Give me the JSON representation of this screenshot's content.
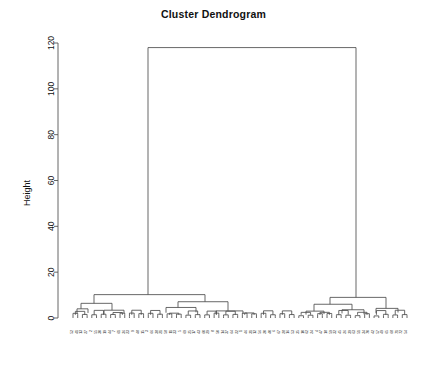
{
  "chart_data": {
    "type": "dendrogram",
    "title": "Cluster Dendrogram",
    "xlabel": "",
    "ylabel": "Height",
    "ylim": [
      0,
      125
    ],
    "yticks": [
      0,
      20,
      40,
      60,
      80,
      100,
      120
    ],
    "ytick_labels": [
      "0",
      "20",
      "40",
      "60",
      "80",
      "100",
      "120"
    ],
    "grid": false,
    "legend": "none",
    "n_leaves": 72,
    "root_height": 118,
    "leaf_labels": [
      "52",
      "41",
      "13",
      "27",
      "2",
      "55",
      "30",
      "19",
      "44",
      "7",
      "61",
      "36",
      "23",
      "9",
      "48",
      "15",
      "3",
      "66",
      "38",
      "21",
      "58",
      "11",
      "33",
      "5",
      "69",
      "25",
      "17",
      "43",
      "60",
      "29",
      "8",
      "50",
      "14",
      "37",
      "64",
      "22",
      "1",
      "46",
      "31",
      "12",
      "56",
      "20",
      "40",
      "6",
      "67",
      "28",
      "16",
      "53",
      "35",
      "10",
      "62",
      "24",
      "4",
      "47",
      "18",
      "59",
      "32",
      "45",
      "26",
      "39",
      "63",
      "51",
      "34",
      "70",
      "42",
      "57",
      "49",
      "65",
      "68",
      "71",
      "72",
      "54"
    ],
    "links": [
      {
        "id": "root",
        "x1": 148,
        "x2": 356,
        "height": 118,
        "h1": 10.2,
        "h2": 9.0
      },
      {
        "id": "L",
        "x1": 94,
        "x2": 205,
        "height": 10.2,
        "h1": 6.4,
        "h2": 7.1
      },
      {
        "id": "L1",
        "x1": 81,
        "x2": 112,
        "height": 6.4,
        "h1": 4.0,
        "h2": 3.4
      },
      {
        "id": "L1a",
        "x1": 77,
        "x2": 88,
        "height": 4.0,
        "h1": 1.9,
        "h2": 2.2
      },
      {
        "id": "L1b",
        "x1": 104,
        "x2": 124,
        "height": 3.4,
        "h1": 1.7,
        "h2": 2.0
      },
      {
        "id": "L2",
        "x1": 178,
        "x2": 228,
        "height": 7.1,
        "h1": 4.6,
        "h2": 3.1
      },
      {
        "id": "L2a",
        "x1": 166,
        "x2": 196,
        "height": 4.6,
        "h1": 2.3,
        "h2": 2.5
      },
      {
        "id": "L2b",
        "x1": 216,
        "x2": 243,
        "height": 3.1,
        "h1": 1.6,
        "h2": 1.8
      },
      {
        "id": "R",
        "x1": 330,
        "x2": 386,
        "height": 9.0,
        "h1": 6.0,
        "h2": 4.2
      },
      {
        "id": "R1",
        "x1": 314,
        "x2": 352,
        "height": 6.0,
        "h1": 3.0,
        "h2": 3.6
      },
      {
        "id": "R1a",
        "x1": 306,
        "x2": 324,
        "height": 3.0,
        "h1": 1.5,
        "h2": 1.7
      },
      {
        "id": "R1b",
        "x1": 342,
        "x2": 364,
        "height": 3.6,
        "h1": 2.0,
        "h2": 1.6
      },
      {
        "id": "R2",
        "x1": 376,
        "x2": 398,
        "height": 4.2,
        "h1": 2.1,
        "h2": 2.4
      }
    ]
  },
  "axes": {
    "y_axis_x": 58,
    "plot_left": 73,
    "plot_right": 407,
    "baseline_y": 318,
    "top_y": 40
  },
  "colors": {
    "background": "#ffffff",
    "line": "#4d4d4d",
    "axis": "#555555",
    "text": "#111111"
  }
}
